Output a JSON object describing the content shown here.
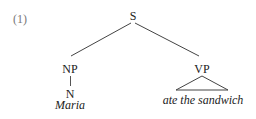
{
  "example_number": "(1)",
  "tree": {
    "root": {
      "label": "S"
    },
    "np": {
      "label": "NP",
      "child": {
        "label": "N",
        "word": "Maria"
      }
    },
    "vp": {
      "label": "VP",
      "abbreviated_phrase": "ate the sandwich"
    }
  }
}
